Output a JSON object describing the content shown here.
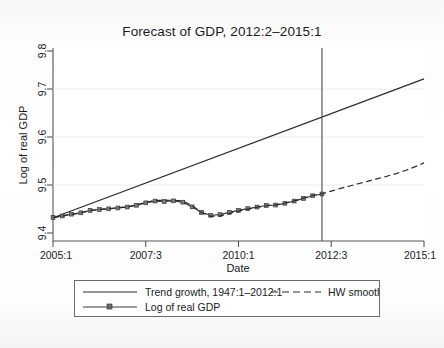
{
  "figure": {
    "title": "Forecast of GDP, 2012:2–2015:1",
    "background_color": "#fbfbfb",
    "plot_background": "#ffffff",
    "frame_color": "#555555"
  },
  "axes": {
    "x_label": "Date",
    "y_label": "Log of real GDP",
    "x_ticks": [
      "2005:1",
      "2007:3",
      "2010:1",
      "2012:3",
      "2015:1"
    ],
    "y_ticks": [
      "9.4",
      "9.5",
      "9.6",
      "9.7",
      "9.8"
    ]
  },
  "legend": {
    "entries": [
      {
        "label": "Trend growth, 1947:1–2012:1",
        "style": "solid"
      },
      {
        "label": "HW smooth",
        "style": "dashed"
      },
      {
        "label": "Log of real GDP",
        "style": "solid-marker"
      }
    ]
  },
  "annotations": {
    "forecast_divider_label": "2012:2",
    "forecast_divider_x": 2012.25
  },
  "chart_data": {
    "type": "line",
    "title": "Forecast of GDP, 2012:2–2015:1",
    "xlabel": "Date",
    "ylabel": "Log of real GDP",
    "xlim": [
      2005.0,
      2015.0
    ],
    "ylim": [
      9.38,
      9.815
    ],
    "grid": true,
    "grid_axis": "y",
    "legend_position": "below",
    "x_tick_values": [
      2005.0,
      2007.5,
      2010.0,
      2012.5,
      2015.0
    ],
    "x_tick_labels": [
      "2005:1",
      "2007:3",
      "2010:1",
      "2012:3",
      "2015:1"
    ],
    "y_tick_values": [
      9.4,
      9.5,
      9.6,
      9.7,
      9.8
    ],
    "y_tick_labels": [
      "9.4",
      "9.5",
      "9.6",
      "9.7",
      "9.8"
    ],
    "vline": {
      "x": 2012.25,
      "color": "#555555",
      "label": "forecast start 2012:2"
    },
    "series": [
      {
        "name": "Trend growth, 1947:1–2012:1",
        "style": "solid",
        "color": "#2a2a2a",
        "marker": "none",
        "x": [
          2005.0,
          2015.0
        ],
        "y": [
          9.4325,
          9.7455
        ]
      },
      {
        "name": "Log of real GDP",
        "style": "solid",
        "color": "#3a3a3a",
        "marker": "square",
        "x": [
          2005.0,
          2005.25,
          2005.5,
          2005.75,
          2006.0,
          2006.25,
          2006.5,
          2006.75,
          2007.0,
          2007.25,
          2007.5,
          2007.75,
          2008.0,
          2008.25,
          2008.5,
          2008.75,
          2009.0,
          2009.25,
          2009.5,
          2009.75,
          2010.0,
          2010.25,
          2010.5,
          2010.75,
          2011.0,
          2011.25,
          2011.5,
          2011.75,
          2012.0,
          2012.25
        ],
        "y": [
          9.433,
          9.4365,
          9.4405,
          9.4435,
          9.449,
          9.451,
          9.4525,
          9.4545,
          9.4565,
          9.4605,
          9.466,
          9.47,
          9.469,
          9.4705,
          9.4675,
          9.457,
          9.4445,
          9.438,
          9.4395,
          9.4445,
          9.449,
          9.453,
          9.4565,
          9.46,
          9.461,
          9.465,
          9.47,
          9.476,
          9.482,
          9.486
        ]
      },
      {
        "name": "HW smooth",
        "style": "dashed",
        "color": "#2a2a2a",
        "marker": "none",
        "x": [
          2005.0,
          2005.25,
          2005.5,
          2005.75,
          2006.0,
          2006.25,
          2006.5,
          2006.75,
          2007.0,
          2007.25,
          2007.5,
          2007.75,
          2008.0,
          2008.25,
          2008.5,
          2008.75,
          2009.0,
          2009.25,
          2009.5,
          2009.75,
          2010.0,
          2010.25,
          2010.5,
          2010.75,
          2011.0,
          2011.25,
          2011.5,
          2011.75,
          2012.0,
          2012.25,
          2012.5,
          2012.75,
          2013.0,
          2013.25,
          2013.5,
          2013.75,
          2014.0,
          2014.25,
          2014.5,
          2014.75,
          2015.0
        ],
        "y": [
          9.4325,
          9.436,
          9.44,
          9.4435,
          9.4485,
          9.451,
          9.453,
          9.455,
          9.457,
          9.4615,
          9.467,
          9.4715,
          9.4715,
          9.472,
          9.47,
          9.46,
          9.444,
          9.4355,
          9.4365,
          9.442,
          9.4475,
          9.452,
          9.456,
          9.4595,
          9.4615,
          9.4655,
          9.4705,
          9.4765,
          9.4825,
          9.4865,
          9.4925,
          9.4985,
          9.504,
          9.5095,
          9.515,
          9.5205,
          9.526,
          9.532,
          9.539,
          9.547,
          9.556
        ]
      }
    ]
  }
}
